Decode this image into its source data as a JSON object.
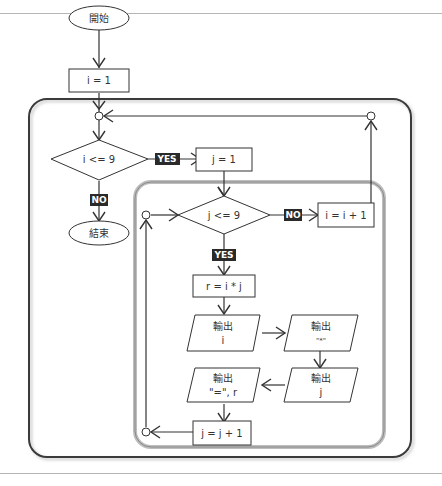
{
  "flowchart": {
    "start": "開始",
    "init_i": "i = 1",
    "cond_i": "i <= 9",
    "yes_i": "YES",
    "no_i": "NO",
    "end": "結束",
    "init_j": "j = 1",
    "cond_j": "j <= 9",
    "yes_j": "YES",
    "no_j": "NO",
    "inc_i": "i = i + 1",
    "calc_r": "r = i * j",
    "out1": {
      "title": "輸出",
      "value": "i"
    },
    "out2": {
      "title": "輸出",
      "value": "\"*\""
    },
    "out3": {
      "title": "輸出",
      "value": "j"
    },
    "out4": {
      "title": "輸出",
      "value": "\"=\", r"
    },
    "inc_j": "j = j + 1"
  },
  "colors": {
    "line": "#333333",
    "tag_bg": "#2a2a2a",
    "outer_loop_border": "#444444",
    "inner_loop_border": "#b0b0b0"
  }
}
